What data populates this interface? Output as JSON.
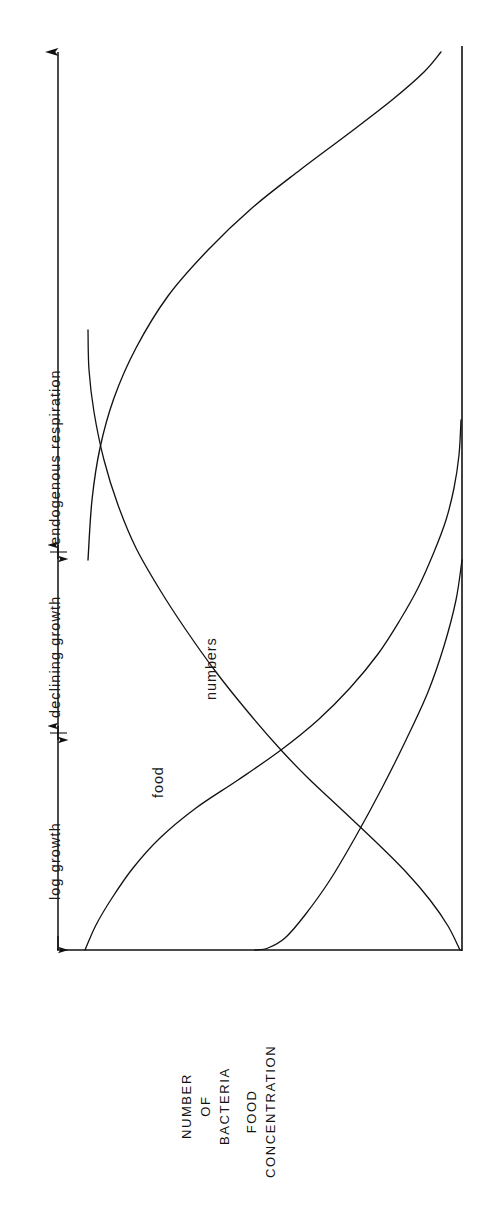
{
  "figure": {
    "background_color": "#ffffff",
    "ink_color": "#111111",
    "width": 484,
    "height": 1206
  },
  "axes": {
    "time_axis": {
      "name": "time-axis",
      "orientation": "vertical",
      "direction": "upward",
      "arrowhead": "up-arrow-icon",
      "x": 58,
      "y_bottom": 950,
      "y_top": 45
    },
    "baseline": {
      "name": "value-baseline",
      "orientation": "horizontal",
      "y": 950,
      "x_left": 58,
      "x_right": 462
    },
    "right_border": {
      "name": "right-border-line",
      "orientation": "vertical",
      "x": 462,
      "y_top": 45,
      "y_bottom": 950
    }
  },
  "phases": [
    {
      "id": "log-growth",
      "label": "log growth",
      "y_start": 950,
      "y_end": 735,
      "label_y": 905
    },
    {
      "id": "declining-growth",
      "label": "declining growth",
      "y_start": 730,
      "y_end": 555,
      "label_y": 718
    },
    {
      "id": "endogenous-respiration",
      "label": "endogenous respiration",
      "y_start": 550,
      "y_end": 50,
      "label_y": 545
    }
  ],
  "phase_dividers": [
    {
      "name": "phase-divider-log-declining",
      "y": 734
    },
    {
      "name": "phase-divider-declining-endogenous",
      "y": 552
    }
  ],
  "curve_labels": [
    {
      "id": "numbers",
      "label": "numbers",
      "x": 213,
      "y": 700
    },
    {
      "id": "food",
      "label": "food",
      "x": 160,
      "y": 800
    }
  ],
  "axis_titles": [
    {
      "id": "number-of-bacteria",
      "lines": [
        "NUMBER",
        "OF",
        "BACTERIA"
      ],
      "x": 200,
      "y": 1140
    },
    {
      "id": "food-concentration",
      "lines": [
        "FOOD",
        "CONCENTRATION"
      ],
      "x": 262,
      "y": 1175
    }
  ],
  "chart_data": {
    "type": "line",
    "title": "",
    "subtitle": "",
    "orientation": "rotated-90-time-on-vertical-axis",
    "xlabel": "NUMBER OF BACTERIA / FOOD CONCENTRATION",
    "ylabel": "time (log growth → declining growth → endogenous respiration)",
    "xlim": [
      0,
      1
    ],
    "ylim": [
      0,
      1
    ],
    "grid": false,
    "legend": "inline-curve-labels",
    "annotations": [
      "log growth",
      "declining growth",
      "endogenous respiration",
      "numbers",
      "food"
    ],
    "crossing_point": {
      "x_px": 281,
      "y_px": 750
    },
    "series": [
      {
        "name": "numbers",
        "description": "number of bacteria: rises steeply during log growth, peaks, then declines through declining growth and endogenous respiration",
        "points_px": [
          [
            85,
            950
          ],
          [
            96,
            925
          ],
          [
            112,
            898
          ],
          [
            133,
            868
          ],
          [
            160,
            838
          ],
          [
            196,
            808
          ],
          [
            238,
            780
          ],
          [
            281,
            750
          ],
          [
            318,
            720
          ],
          [
            350,
            688
          ],
          [
            378,
            654
          ],
          [
            400,
            620
          ],
          [
            418,
            588
          ],
          [
            434,
            552
          ],
          [
            446,
            520
          ],
          [
            454,
            488
          ],
          [
            459,
            455
          ],
          [
            461,
            420
          ]
        ]
      },
      {
        "name": "food",
        "description": "food concentration: starts high at time zero, drops rapidly during log growth and declining growth, approaching zero in endogenous respiration",
        "points_px": [
          [
            460,
            950
          ],
          [
            448,
            926
          ],
          [
            430,
            900
          ],
          [
            406,
            872
          ],
          [
            376,
            842
          ],
          [
            340,
            808
          ],
          [
            308,
            778
          ],
          [
            281,
            750
          ],
          [
            248,
            712
          ],
          [
            216,
            672
          ],
          [
            186,
            630
          ],
          [
            160,
            590
          ],
          [
            136,
            548
          ],
          [
            118,
            505
          ],
          [
            104,
            460
          ],
          [
            94,
            412
          ],
          [
            89,
            370
          ],
          [
            88,
            330
          ]
        ]
      }
    ],
    "series_continuations": [
      {
        "name": "numbers-decline-tail",
        "points_px": [
          [
            88,
            560
          ],
          [
            92,
            500
          ],
          [
            100,
            448
          ],
          [
            114,
            398
          ],
          [
            136,
            348
          ],
          [
            168,
            296
          ],
          [
            208,
            250
          ],
          [
            252,
            208
          ],
          [
            300,
            170
          ],
          [
            348,
            134
          ],
          [
            392,
            100
          ],
          [
            424,
            72
          ],
          [
            441,
            52
          ]
        ]
      },
      {
        "name": "food-residual-tail",
        "points_px": [
          [
            462,
            560
          ],
          [
            456,
            600
          ],
          [
            444,
            646
          ],
          [
            428,
            692
          ],
          [
            406,
            740
          ],
          [
            382,
            788
          ],
          [
            356,
            836
          ],
          [
            330,
            880
          ],
          [
            305,
            915
          ],
          [
            285,
            938
          ],
          [
            268,
            948
          ],
          [
            255,
            950
          ]
        ]
      }
    ]
  }
}
